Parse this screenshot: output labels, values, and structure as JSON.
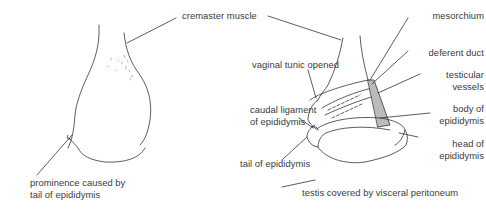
{
  "diagram": {
    "title": "",
    "colors": {
      "ink": "#333333",
      "text": "#3a3a3a",
      "background": "#ffffff",
      "hatch": "#555555"
    },
    "figures": [
      {
        "id": "external-view",
        "description": "Testis and cremaster muscle, external view"
      },
      {
        "id": "opened-view",
        "description": "Testis with vaginal tunic opened"
      }
    ],
    "labels": {
      "cremaster_muscle": "cremaster muscle",
      "mesorchium": "mesorchium",
      "deferent_duct": "deferent duct",
      "vaginal_tunic_opened": "vaginal tunic opened",
      "testicular_vessels_1": "testicular",
      "testicular_vessels_2": "vessels",
      "caudal_ligament_1": "caudal ligament",
      "caudal_ligament_2": "of epididymis",
      "body_of_epididymis_1": "body of",
      "body_of_epididymis_2": "epididymis",
      "head_of_epididymis_1": "head of",
      "head_of_epididymis_2": "epididymis",
      "tail_of_epididymis": "tail of epididymis",
      "prominence_1": "prominence caused by",
      "prominence_2": "tail of epididymis",
      "testis_covered": "testis covered by visceral peritoneum"
    }
  }
}
